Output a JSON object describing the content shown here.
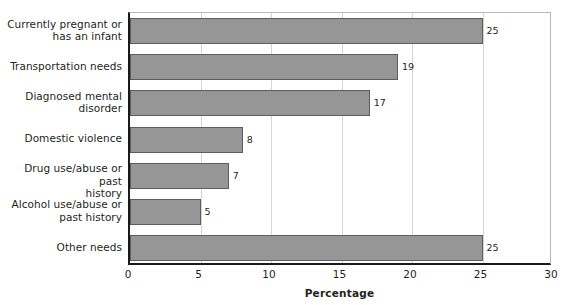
{
  "chart_data": {
    "type": "bar",
    "orientation": "horizontal",
    "title": "",
    "subtitle": "",
    "xlabel": "Percentage",
    "ylabel": "",
    "xlim": [
      0,
      30
    ],
    "xticks": [
      "0",
      "5",
      "10",
      "15",
      "20",
      "25",
      "30"
    ],
    "grid": "vertical",
    "legend": "none",
    "categories": [
      "Currently pregnant or\nhas an infant",
      "Transportation needs",
      "Diagnosed mental\ndisorder",
      "Domestic violence",
      "Drug use/abuse or past\nhistory",
      "Alcohol use/abuse or\npast history",
      "Other needs"
    ],
    "values": [
      25,
      19,
      17,
      8,
      7,
      5,
      25
    ],
    "value_labels": [
      "25",
      "19",
      "17",
      "8",
      "7",
      "5",
      "25"
    ],
    "colors": {
      "bar_fill": "#969696",
      "bar_border": "#5d5d5d",
      "axis": "#1a1a1a",
      "gridline": "#d4d4d4",
      "frame": "#b9b9b9",
      "text": "#231f20",
      "background": "#ffffff"
    }
  }
}
